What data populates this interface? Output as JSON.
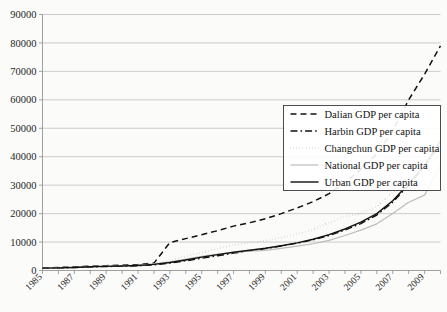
{
  "chart_data": {
    "type": "line",
    "title": "",
    "xlabel": "",
    "ylabel": "",
    "ylim": [
      0,
      90000
    ],
    "xlim": [
      1985,
      2010
    ],
    "grid": true,
    "legend_position": "right-middle",
    "y_ticks": [
      "0",
      "10000",
      "20000",
      "30000",
      "40000",
      "50000",
      "60000",
      "70000",
      "80000",
      "90000"
    ],
    "x_tick_labels": [
      "1985",
      "1987",
      "1989",
      "1991",
      "1993",
      "1995",
      "1997",
      "1999",
      "2001",
      "2003",
      "2005",
      "2007",
      "2009"
    ],
    "x": [
      1985,
      1986,
      1987,
      1988,
      1989,
      1990,
      1991,
      1992,
      1993,
      1994,
      1995,
      1996,
      1997,
      1998,
      1999,
      2000,
      2001,
      2002,
      2003,
      2004,
      2005,
      2006,
      2007,
      2008,
      2009,
      2010
    ],
    "series": [
      {
        "name": "Dalian GDP per capita",
        "style": "dashed",
        "color": "#111111",
        "values": [
          900,
          1050,
          1250,
          1500,
          1700,
          1850,
          2100,
          2600,
          9800,
          11200,
          12600,
          14000,
          15600,
          16800,
          18200,
          20000,
          22000,
          24200,
          27000,
          31000,
          35500,
          41000,
          49000,
          60000,
          69000,
          79000
        ]
      },
      {
        "name": "Harbin GDP per capita",
        "style": "dash-dot",
        "color": "#111111",
        "values": [
          800,
          900,
          1050,
          1250,
          1400,
          1500,
          1700,
          2000,
          2600,
          3400,
          4300,
          5200,
          6100,
          6900,
          7700,
          8600,
          9600,
          10800,
          12300,
          14200,
          16500,
          19500,
          24000,
          30000,
          36500,
          44500
        ]
      },
      {
        "name": "Changchun GDP per capita",
        "style": "dotted",
        "color": "#111111",
        "values": [
          850,
          980,
          1150,
          1400,
          1600,
          1750,
          2000,
          2500,
          3600,
          5000,
          6400,
          7700,
          8900,
          9700,
          10500,
          11500,
          12800,
          14500,
          16800,
          19000,
          20000,
          22500,
          27500,
          34000,
          39500,
          46000
        ]
      },
      {
        "name": "National GDP per capita",
        "style": "solid-light",
        "color": "#bdbdbd",
        "values": [
          860,
          960,
          1110,
          1360,
          1510,
          1640,
          1890,
          2300,
          3000,
          4000,
          5000,
          5800,
          6400,
          6800,
          7100,
          7800,
          8600,
          9400,
          10600,
          12300,
          14200,
          16400,
          20000,
          24000,
          26500,
          37000
        ]
      },
      {
        "name": "Urban GDP per capita",
        "style": "solid",
        "color": "#111111",
        "values": [
          820,
          930,
          1080,
          1300,
          1450,
          1560,
          1780,
          2150,
          2800,
          3700,
          4700,
          5600,
          6400,
          7100,
          7800,
          8700,
          9700,
          11000,
          12600,
          14600,
          17000,
          20000,
          24500,
          30500,
          37000,
          45500
        ]
      }
    ]
  },
  "legend": {
    "items": [
      {
        "label": "Dalian GDP per capita",
        "style": "dashed"
      },
      {
        "label": "Harbin GDP per capita",
        "style": "dash-dot"
      },
      {
        "label": "Changchun GDP per capita",
        "style": "dotted"
      },
      {
        "label": "National GDP per capita",
        "style": "solid-light"
      },
      {
        "label": "Urban GDP per capita",
        "style": "solid"
      }
    ]
  }
}
